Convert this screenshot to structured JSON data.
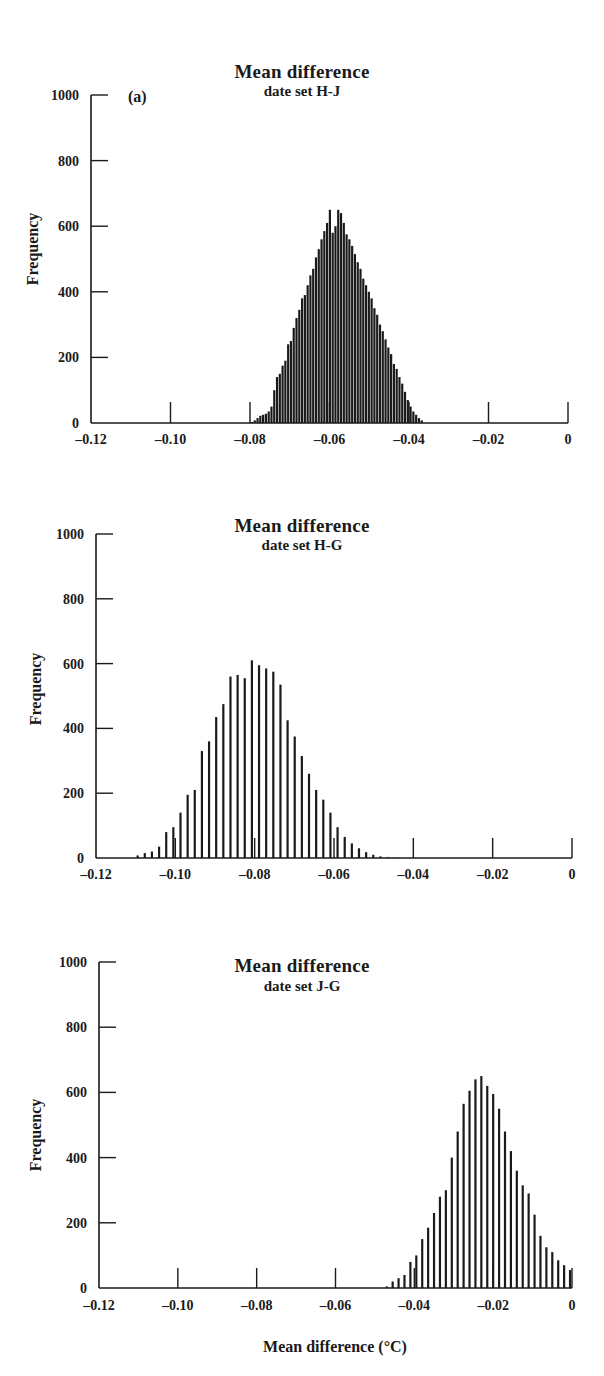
{
  "figure": {
    "xlabel": "Mean difference (°C)",
    "ylabel": "Frequency",
    "panel_label": "(a)",
    "bar_color": "#1a1a1a"
  },
  "chart_data": [
    {
      "type": "bar",
      "title": "Mean difference",
      "subtitle": "date set H-J",
      "xlabel": "Mean difference (°C)",
      "ylabel": "Frequency",
      "xlim": [
        -0.12,
        0
      ],
      "ylim": [
        0,
        1000
      ],
      "xticks": [
        "-0.12",
        "-0.10",
        "-0.08",
        "-0.06",
        "-0.04",
        "-0.02",
        "0"
      ],
      "yticks": [
        "0",
        "200",
        "400",
        "600",
        "800",
        "1000"
      ],
      "annotation": "(a)",
      "x": [
        -0.0795,
        -0.0788,
        -0.0781,
        -0.0774,
        -0.0767,
        -0.076,
        -0.0753,
        -0.0746,
        -0.0739,
        -0.0732,
        -0.0725,
        -0.0718,
        -0.0711,
        -0.0704,
        -0.0697,
        -0.069,
        -0.0683,
        -0.0676,
        -0.0669,
        -0.0662,
        -0.0655,
        -0.0648,
        -0.0641,
        -0.0634,
        -0.0627,
        -0.062,
        -0.0613,
        -0.0606,
        -0.0599,
        -0.0592,
        -0.0585,
        -0.0578,
        -0.0571,
        -0.0564,
        -0.0557,
        -0.055,
        -0.0543,
        -0.0536,
        -0.0529,
        -0.0522,
        -0.0515,
        -0.0508,
        -0.0501,
        -0.0494,
        -0.0487,
        -0.048,
        -0.0473,
        -0.0466,
        -0.0459,
        -0.0452,
        -0.0445,
        -0.0438,
        -0.0431,
        -0.0424,
        -0.0417,
        -0.041,
        -0.0403,
        -0.0396,
        -0.0389,
        -0.0382,
        -0.0375,
        -0.0368
      ],
      "values": [
        3,
        8,
        15,
        22,
        25,
        28,
        35,
        50,
        100,
        140,
        150,
        175,
        190,
        240,
        250,
        290,
        320,
        345,
        380,
        390,
        420,
        450,
        470,
        505,
        530,
        560,
        585,
        610,
        650,
        580,
        600,
        650,
        640,
        610,
        575,
        560,
        540,
        515,
        490,
        470,
        440,
        420,
        400,
        380,
        350,
        330,
        300,
        280,
        255,
        230,
        210,
        180,
        165,
        140,
        120,
        95,
        70,
        50,
        35,
        25,
        15,
        8
      ]
    },
    {
      "type": "bar",
      "title": "Mean difference",
      "subtitle": "date set H-G",
      "xlabel": "Mean difference (°C)",
      "ylabel": "Frequency",
      "xlim": [
        -0.12,
        0
      ],
      "ylim": [
        0,
        1000
      ],
      "xticks": [
        "-0.12",
        "-0.10",
        "-0.08",
        "-0.06",
        "-0.04",
        "-0.02",
        "0"
      ],
      "yticks": [
        "0",
        "200",
        "400",
        "600",
        "800",
        "1000"
      ],
      "x": [
        -0.1095,
        -0.1077,
        -0.1059,
        -0.1041,
        -0.1023,
        -0.1005,
        -0.0987,
        -0.0969,
        -0.0951,
        -0.0933,
        -0.0915,
        -0.0897,
        -0.0879,
        -0.0861,
        -0.0843,
        -0.0825,
        -0.0807,
        -0.0789,
        -0.0771,
        -0.0753,
        -0.0735,
        -0.0717,
        -0.0699,
        -0.0681,
        -0.0663,
        -0.0645,
        -0.0627,
        -0.0609,
        -0.0591,
        -0.0573,
        -0.0555,
        -0.0537,
        -0.0519,
        -0.0501,
        -0.0483,
        -0.0465,
        -0.0447
      ],
      "values": [
        8,
        15,
        20,
        35,
        80,
        95,
        140,
        195,
        210,
        330,
        360,
        435,
        475,
        560,
        565,
        555,
        610,
        595,
        585,
        575,
        535,
        425,
        375,
        315,
        260,
        210,
        180,
        140,
        95,
        65,
        45,
        30,
        18,
        10,
        5,
        3,
        1
      ]
    },
    {
      "type": "bar",
      "title": "Mean difference",
      "subtitle": "date set J-G",
      "xlabel": "Mean difference (°C)",
      "ylabel": "Frequency",
      "xlim": [
        -0.12,
        0
      ],
      "ylim": [
        0,
        1000
      ],
      "xticks": [
        "-0.12",
        "-0.10",
        "-0.08",
        "-0.06",
        "-0.04",
        "-0.02",
        "0"
      ],
      "yticks": [
        "0",
        "200",
        "400",
        "600",
        "800",
        "1000"
      ],
      "x": [
        -0.047,
        -0.0455,
        -0.044,
        -0.0425,
        -0.041,
        -0.0395,
        -0.038,
        -0.0365,
        -0.035,
        -0.0335,
        -0.032,
        -0.0305,
        -0.029,
        -0.0275,
        -0.026,
        -0.0245,
        -0.023,
        -0.0215,
        -0.02,
        -0.0185,
        -0.017,
        -0.0155,
        -0.014,
        -0.0125,
        -0.011,
        -0.0095,
        -0.008,
        -0.0065,
        -0.005,
        -0.0035,
        -0.002,
        -0.0005
      ],
      "values": [
        5,
        20,
        30,
        40,
        80,
        100,
        150,
        185,
        230,
        280,
        300,
        400,
        480,
        565,
        605,
        640,
        650,
        620,
        595,
        550,
        480,
        420,
        360,
        315,
        290,
        225,
        160,
        125,
        110,
        85,
        70,
        55
      ]
    }
  ]
}
